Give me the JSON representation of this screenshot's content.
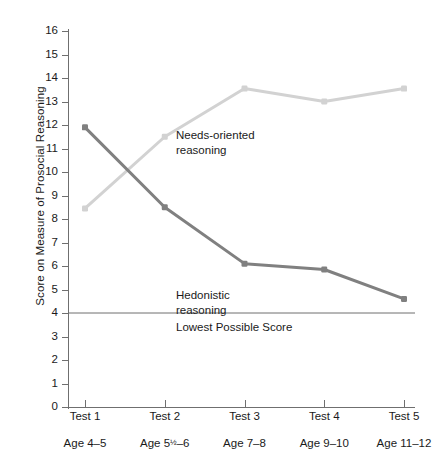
{
  "chart_data": {
    "type": "line",
    "title": "",
    "xlabel": "",
    "ylabel": "Score on Measure of Prosocial Reasoning",
    "categories": [
      "Test 1",
      "Test 2",
      "Test 3",
      "Test 4",
      "Test 5"
    ],
    "category_sublabels": [
      "Age 4–5",
      "Age 5½–6",
      "Age 7–8",
      "Age 9–10",
      "Age 11–12"
    ],
    "ylim": [
      0,
      16
    ],
    "yticks": [
      0,
      1,
      2,
      3,
      4,
      5,
      6,
      7,
      8,
      9,
      10,
      11,
      12,
      13,
      14,
      15,
      16
    ],
    "grid": false,
    "legend_position": "inline-annotations",
    "series": [
      {
        "name": "Hedonistic reasoning",
        "color": "#808080",
        "values": [
          11.9,
          8.5,
          6.1,
          5.85,
          4.6
        ]
      },
      {
        "name": "Needs-oriented reasoning",
        "color": "#d2d2d2",
        "values": [
          8.45,
          11.5,
          13.55,
          13.0,
          13.55
        ]
      }
    ],
    "reference_line": {
      "label": "Lowest Possible Score",
      "value": 4,
      "color": "#6f6f6f"
    },
    "annotations": [
      {
        "text": "Needs-oriented\nreasoning",
        "series": "Needs-oriented reasoning"
      },
      {
        "text": "Hedonistic\nreasoning",
        "series": "Hedonistic reasoning"
      }
    ]
  },
  "axis": {
    "y_title": "Score on Measure of Prosocial Reasoning",
    "y_tick_labels": [
      "16",
      "15",
      "14",
      "13",
      "12",
      "11",
      "10",
      "9",
      "8",
      "7",
      "6",
      "5",
      "4",
      "3",
      "2",
      "1",
      "0"
    ]
  },
  "labels": {
    "needs_oriented": "Needs-oriented\nreasoning",
    "hedonistic": "Hedonistic\nreasoning",
    "lowest_possible": "Lowest Possible Score"
  },
  "x_axis": {
    "ticks": [
      {
        "label": "Test 1",
        "sub_prefix": "Age 4–5",
        "sub_num": "",
        "sub_frac": "",
        "sub_suffix": ""
      },
      {
        "label": "Test 2",
        "sub_prefix": "Age 5",
        "sub_num": "",
        "sub_frac": "½",
        "sub_suffix": "–6"
      },
      {
        "label": "Test 3",
        "sub_prefix": "Age 7–8",
        "sub_num": "",
        "sub_frac": "",
        "sub_suffix": ""
      },
      {
        "label": "Test 4",
        "sub_prefix": "Age 9–10",
        "sub_num": "",
        "sub_frac": "",
        "sub_suffix": ""
      },
      {
        "label": "Test 5",
        "sub_prefix": "Age 11–12",
        "sub_num": "",
        "sub_frac": "",
        "sub_suffix": ""
      }
    ]
  },
  "colors": {
    "hedonistic": "#808080",
    "needs_oriented": "#d2d2d2",
    "axis": "#6f6f6f",
    "text": "#1a1a1a",
    "background": "#ffffff"
  }
}
